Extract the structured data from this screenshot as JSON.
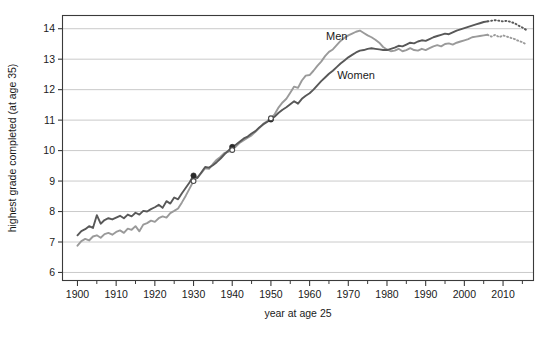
{
  "chart_data": {
    "type": "line",
    "title": "",
    "xlabel": "year at age 25",
    "ylabel": "highest grade completed (at age 35)",
    "xlim": [
      1896,
      2018
    ],
    "ylim": [
      5.72,
      14.45
    ],
    "xticks": [
      1900,
      1910,
      1920,
      1930,
      1940,
      1950,
      1960,
      1970,
      1980,
      1990,
      2000,
      2010
    ],
    "xtick_labels": [
      "1900",
      "1910",
      "1920",
      "1930",
      "1940",
      "1950",
      "1960",
      "1970",
      "1980",
      "1990",
      "2000",
      "2010"
    ],
    "xminorticks": [
      1905,
      1915,
      1925,
      1935,
      1945,
      1955,
      1965,
      1975,
      1985,
      1995,
      2005,
      2015
    ],
    "yticks": [
      6,
      7,
      8,
      9,
      10,
      11,
      12,
      13,
      14
    ],
    "ytick_labels": [
      "6",
      "7",
      "8",
      "9",
      "10",
      "11",
      "12",
      "13",
      "14"
    ],
    "grid": "horizontal",
    "grid_color": "#bdbdbd",
    "legend_position": "inline-annotations",
    "annotations": [
      {
        "text": "Men",
        "x": 1967,
        "y": 13.62,
        "color": "#9a9a9a"
      },
      {
        "text": "Women",
        "x": 1972,
        "y": 12.35,
        "color": "#555555"
      }
    ],
    "markers": [
      {
        "series": "Women",
        "x": 1930,
        "y": 9.18,
        "style": "filled-circle"
      },
      {
        "series": "Men",
        "x": 1930,
        "y": 9.0,
        "style": "open-circle"
      },
      {
        "series": "Women",
        "x": 1940,
        "y": 10.12,
        "style": "filled-circle"
      },
      {
        "series": "Men",
        "x": 1940,
        "y": 10.02,
        "style": "open-circle"
      },
      {
        "series": "Women",
        "x": 1950,
        "y": 11.02,
        "style": "filled-circle"
      },
      {
        "series": "Men",
        "x": 1950,
        "y": 11.06,
        "style": "open-circle"
      }
    ],
    "series": [
      {
        "name": "Men",
        "color": "#9a9a9a",
        "solid_end_year": 2006,
        "x": [
          1900,
          1901,
          1902,
          1903,
          1904,
          1905,
          1906,
          1907,
          1908,
          1909,
          1910,
          1911,
          1912,
          1913,
          1914,
          1915,
          1916,
          1917,
          1918,
          1919,
          1920,
          1921,
          1922,
          1923,
          1924,
          1925,
          1926,
          1927,
          1928,
          1929,
          1930,
          1931,
          1932,
          1933,
          1934,
          1935,
          1936,
          1937,
          1938,
          1939,
          1940,
          1941,
          1942,
          1943,
          1944,
          1945,
          1946,
          1947,
          1948,
          1949,
          1950,
          1951,
          1952,
          1953,
          1954,
          1955,
          1956,
          1957,
          1958,
          1959,
          1960,
          1961,
          1962,
          1963,
          1964,
          1965,
          1966,
          1967,
          1968,
          1969,
          1970,
          1971,
          1972,
          1973,
          1974,
          1975,
          1976,
          1977,
          1978,
          1979,
          1980,
          1981,
          1982,
          1983,
          1984,
          1985,
          1986,
          1987,
          1988,
          1989,
          1990,
          1991,
          1992,
          1993,
          1994,
          1995,
          1996,
          1997,
          1998,
          1999,
          2000,
          2001,
          2002,
          2003,
          2004,
          2005,
          2006,
          2007,
          2008,
          2009,
          2010,
          2011,
          2012,
          2013,
          2014,
          2015,
          2016
        ],
        "y": [
          6.88,
          7.03,
          7.1,
          7.05,
          7.18,
          7.22,
          7.14,
          7.26,
          7.3,
          7.24,
          7.33,
          7.38,
          7.3,
          7.44,
          7.4,
          7.52,
          7.35,
          7.57,
          7.62,
          7.7,
          7.66,
          7.78,
          7.84,
          7.8,
          7.95,
          8.02,
          8.1,
          8.3,
          8.52,
          8.76,
          9.0,
          9.12,
          9.26,
          9.42,
          9.4,
          9.56,
          9.7,
          9.8,
          9.92,
          9.96,
          10.02,
          10.14,
          10.26,
          10.34,
          10.42,
          10.5,
          10.62,
          10.74,
          10.88,
          10.96,
          11.06,
          11.2,
          11.42,
          11.58,
          11.7,
          11.9,
          12.1,
          12.06,
          12.3,
          12.46,
          12.48,
          12.62,
          12.78,
          12.92,
          13.1,
          13.24,
          13.32,
          13.46,
          13.6,
          13.7,
          13.78,
          13.84,
          13.9,
          13.94,
          13.86,
          13.78,
          13.72,
          13.64,
          13.54,
          13.4,
          13.32,
          13.26,
          13.28,
          13.34,
          13.26,
          13.3,
          13.36,
          13.3,
          13.28,
          13.34,
          13.3,
          13.36,
          13.42,
          13.46,
          13.42,
          13.5,
          13.52,
          13.48,
          13.54,
          13.58,
          13.62,
          13.66,
          13.72,
          13.74,
          13.76,
          13.78,
          13.8,
          13.74,
          13.8,
          13.72,
          13.78,
          13.74,
          13.7,
          13.66,
          13.6,
          13.56,
          13.48
        ]
      },
      {
        "name": "Women",
        "color": "#585858",
        "solid_end_year": 2006,
        "x": [
          1900,
          1901,
          1902,
          1903,
          1904,
          1905,
          1906,
          1907,
          1908,
          1909,
          1910,
          1911,
          1912,
          1913,
          1914,
          1915,
          1916,
          1917,
          1918,
          1919,
          1920,
          1921,
          1922,
          1923,
          1924,
          1925,
          1926,
          1927,
          1928,
          1929,
          1930,
          1931,
          1932,
          1933,
          1934,
          1935,
          1936,
          1937,
          1938,
          1939,
          1940,
          1941,
          1942,
          1943,
          1944,
          1945,
          1946,
          1947,
          1948,
          1949,
          1950,
          1951,
          1952,
          1953,
          1954,
          1955,
          1956,
          1957,
          1958,
          1959,
          1960,
          1961,
          1962,
          1963,
          1964,
          1965,
          1966,
          1967,
          1968,
          1969,
          1970,
          1971,
          1972,
          1973,
          1974,
          1975,
          1976,
          1977,
          1978,
          1979,
          1980,
          1981,
          1982,
          1983,
          1984,
          1985,
          1986,
          1987,
          1988,
          1989,
          1990,
          1991,
          1992,
          1993,
          1994,
          1995,
          1996,
          1997,
          1998,
          1999,
          2000,
          2001,
          2002,
          2003,
          2004,
          2005,
          2006,
          2007,
          2008,
          2009,
          2010,
          2011,
          2012,
          2013,
          2014,
          2015,
          2016
        ],
        "y": [
          7.22,
          7.36,
          7.42,
          7.52,
          7.46,
          7.88,
          7.6,
          7.72,
          7.78,
          7.74,
          7.8,
          7.86,
          7.78,
          7.9,
          7.84,
          7.96,
          7.9,
          8.02,
          8.0,
          8.08,
          8.14,
          8.22,
          8.12,
          8.34,
          8.26,
          8.46,
          8.4,
          8.6,
          8.78,
          8.96,
          9.18,
          9.1,
          9.28,
          9.46,
          9.44,
          9.52,
          9.62,
          9.74,
          9.88,
          10.0,
          10.12,
          10.2,
          10.3,
          10.4,
          10.46,
          10.56,
          10.64,
          10.76,
          10.86,
          10.94,
          11.02,
          11.12,
          11.24,
          11.34,
          11.42,
          11.52,
          11.62,
          11.54,
          11.7,
          11.8,
          11.88,
          12.0,
          12.14,
          12.28,
          12.4,
          12.52,
          12.62,
          12.74,
          12.86,
          12.96,
          13.06,
          13.14,
          13.22,
          13.28,
          13.3,
          13.34,
          13.36,
          13.34,
          13.32,
          13.3,
          13.3,
          13.34,
          13.38,
          13.44,
          13.42,
          13.48,
          13.54,
          13.52,
          13.58,
          13.62,
          13.6,
          13.66,
          13.72,
          13.76,
          13.8,
          13.84,
          13.82,
          13.88,
          13.94,
          13.98,
          14.02,
          14.06,
          14.1,
          14.14,
          14.18,
          14.22,
          14.24,
          14.26,
          14.28,
          14.26,
          14.24,
          14.26,
          14.22,
          14.18,
          14.1,
          14.04,
          13.96
        ]
      }
    ]
  }
}
